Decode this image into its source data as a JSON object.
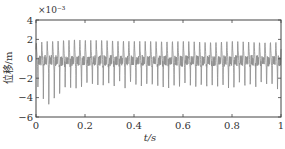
{
  "chart_data": {
    "type": "line",
    "title": "",
    "xlabel": "t/s",
    "ylabel": "位移/m",
    "y_exponent_label": "×10⁻³",
    "xlim": [
      0,
      1
    ],
    "ylim": [
      -6,
      4
    ],
    "x_ticks": [
      "0",
      "0.2",
      "0.4",
      "0.6",
      "0.8",
      "1"
    ],
    "y_ticks": [
      "4",
      "2",
      "0",
      "-2",
      "-4",
      "-6"
    ],
    "grid": false,
    "legend": null,
    "line_color": "#8c8c8c",
    "series": [
      {
        "name": "displacement",
        "description": "Dense periodic oscillation (~45 cycles over 1 s) with upward peaks near 1.5–2×10⁻³ m and downward spikes around -2 to -3×10⁻³ m; largest negative spikes (~-4.8×10⁻³ m) occur near t≈0.02–0.2 s",
        "cycles": 45,
        "peak_max": 2.0,
        "trough_typical": -2.6,
        "trough_min": -4.8,
        "envelope_samples": {
          "t": [
            0.0,
            0.02,
            0.04,
            0.06,
            0.08,
            0.1,
            0.15,
            0.2,
            0.3,
            0.4,
            0.5,
            0.6,
            0.7,
            0.8,
            0.9,
            1.0
          ],
          "upper": [
            1.6,
            1.7,
            1.8,
            1.8,
            1.8,
            1.9,
            2.0,
            1.9,
            1.9,
            1.8,
            1.8,
            1.8,
            1.7,
            1.8,
            1.7,
            1.7
          ],
          "lower": [
            -2.5,
            -3.5,
            -4.0,
            -4.8,
            -4.5,
            -3.5,
            -3.0,
            -2.8,
            -2.6,
            -2.7,
            -2.6,
            -2.7,
            -2.8,
            -2.7,
            -2.8,
            -2.8
          ]
        }
      }
    ]
  }
}
